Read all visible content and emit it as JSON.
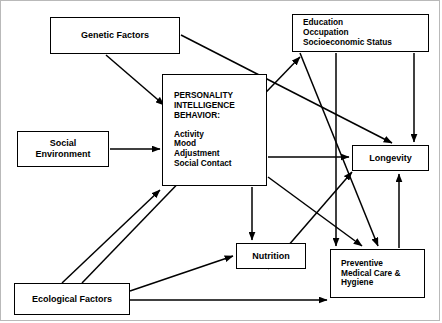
{
  "diagram": {
    "type": "flow-diagram",
    "title": "",
    "stroke_color": "#000000",
    "background_color": "#ffffff",
    "frame_color": "#b9b9b9",
    "nodes": [
      {
        "id": "genetic",
        "label": "Genetic Factors",
        "lines": [
          "Genetic Factors"
        ]
      },
      {
        "id": "social",
        "label": "Social Environment",
        "lines": [
          "Social",
          "Environment"
        ]
      },
      {
        "id": "ecological",
        "label": "Ecological Factors",
        "lines": [
          "Ecological Factors"
        ]
      },
      {
        "id": "personality",
        "label": "PERSONALITY INTELLIGENCE BEHAVIOR",
        "heading_lines": [
          "PERSONALITY",
          "INTELLIGENCE",
          "BEHAVIOR:"
        ],
        "item_lines": [
          "Activity",
          "Mood",
          "Adjustment",
          "Social Contact"
        ]
      },
      {
        "id": "education",
        "label": "Education Occupation Socioeconomic Status",
        "lines": [
          "Education",
          "Occupation",
          "Socioeconomic Status"
        ]
      },
      {
        "id": "longevity",
        "label": "Longevity",
        "lines": [
          "Longevity"
        ]
      },
      {
        "id": "preventive",
        "label": "Preventive Medical Care & Hygiene",
        "lines": [
          "Preventive",
          "Medical Care &",
          "Hygiene"
        ]
      },
      {
        "id": "nutrition",
        "label": "Nutrition",
        "lines": [
          "Nutrition"
        ]
      }
    ],
    "edges": [
      {
        "from": "genetic",
        "to": "personality"
      },
      {
        "from": "genetic",
        "to": "longevity"
      },
      {
        "from": "social",
        "to": "personality"
      },
      {
        "from": "ecological",
        "to": "personality"
      },
      {
        "from": "ecological",
        "to": "education"
      },
      {
        "from": "ecological",
        "to": "nutrition"
      },
      {
        "from": "ecological",
        "to": "preventive"
      },
      {
        "from": "education",
        "to": "longevity"
      },
      {
        "from": "education",
        "to": "nutrition"
      },
      {
        "from": "education",
        "to": "preventive"
      },
      {
        "from": "personality",
        "to": "longevity"
      },
      {
        "from": "personality",
        "to": "nutrition"
      },
      {
        "from": "personality",
        "to": "preventive"
      },
      {
        "from": "preventive",
        "to": "longevity"
      },
      {
        "from": "nutrition",
        "to": "longevity"
      }
    ]
  }
}
